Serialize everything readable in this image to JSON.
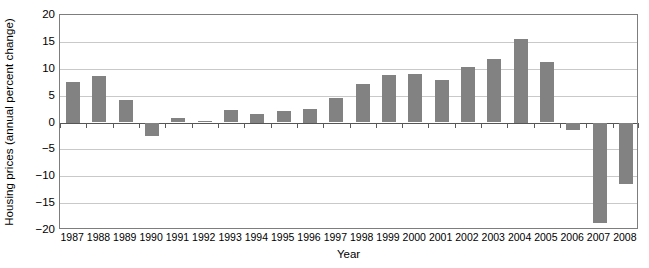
{
  "chart_data": {
    "type": "bar",
    "title": "",
    "subtitle": "",
    "xlabel": "Year",
    "ylabel": "Housing prices (annual percent change)",
    "categories": [
      "1987",
      "1988",
      "1989",
      "1990",
      "1991",
      "1992",
      "1993",
      "1994",
      "1995",
      "1996",
      "1997",
      "1998",
      "1999",
      "2000",
      "2001",
      "2002",
      "2003",
      "2004",
      "2005",
      "2006",
      "2007",
      "2008"
    ],
    "values": [
      7.5,
      8.7,
      4.2,
      -2.6,
      0.9,
      0.2,
      2.4,
      1.5,
      2.1,
      2.5,
      4.6,
      7.2,
      8.8,
      9.1,
      7.9,
      10.4,
      11.9,
      15.5,
      11.3,
      -1.4,
      -18.7,
      -11.5
    ],
    "ylim": [
      -20,
      20
    ],
    "yticks": [
      20,
      15,
      10,
      5,
      0,
      -5,
      -10,
      -15,
      -20
    ],
    "ytick_labels": [
      "20",
      "15",
      "10",
      "5",
      "0",
      "−5",
      "−10",
      "−15",
      "−20"
    ],
    "grid": true,
    "legend_position": "none",
    "series_color": "#828282",
    "gridline_color": "#c9c9c9",
    "axis_color": "#7d7d7d",
    "background_color": "#ffffff"
  }
}
